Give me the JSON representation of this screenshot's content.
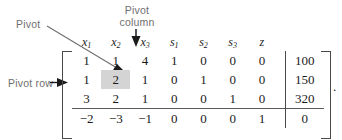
{
  "figure": {
    "trailing_punctuation": "."
  },
  "annotations": {
    "pivot": "Pivot",
    "pivot_column_line1": "Pivot",
    "pivot_column_line2": "column",
    "pivot_row": "Pivot row",
    "arrow_color": "#6f6f6f",
    "label_color": "#6f6f6f",
    "arrowhead_color": "#1b1b1b"
  },
  "tableau": {
    "headers": [
      {
        "base": "x",
        "sub": "1"
      },
      {
        "base": "x",
        "sub": "2"
      },
      {
        "base": "x",
        "sub": "3"
      },
      {
        "base": "s",
        "sub": "1"
      },
      {
        "base": "s",
        "sub": "2"
      },
      {
        "base": "s",
        "sub": "3"
      },
      {
        "base": "z",
        "sub": ""
      }
    ],
    "rows": [
      {
        "coeffs": [
          "1",
          "1",
          "4",
          "1",
          "0",
          "0",
          "0"
        ],
        "rhs": "100"
      },
      {
        "coeffs": [
          "1",
          "2",
          "1",
          "0",
          "1",
          "0",
          "0"
        ],
        "rhs": "150"
      },
      {
        "coeffs": [
          "3",
          "2",
          "1",
          "0",
          "0",
          "1",
          "0"
        ],
        "rhs": "320"
      },
      {
        "coeffs": [
          "−2",
          "−3",
          "−1",
          "0",
          "0",
          "0",
          "1"
        ],
        "rhs": "0"
      }
    ],
    "pivot": {
      "row_index": 1,
      "column_index": 1,
      "value": "2",
      "highlight_color": "#d4d4d4"
    },
    "objective_row_index": 3,
    "text_color": "#1b1b1b",
    "rule_color": "#5a5a5a"
  }
}
